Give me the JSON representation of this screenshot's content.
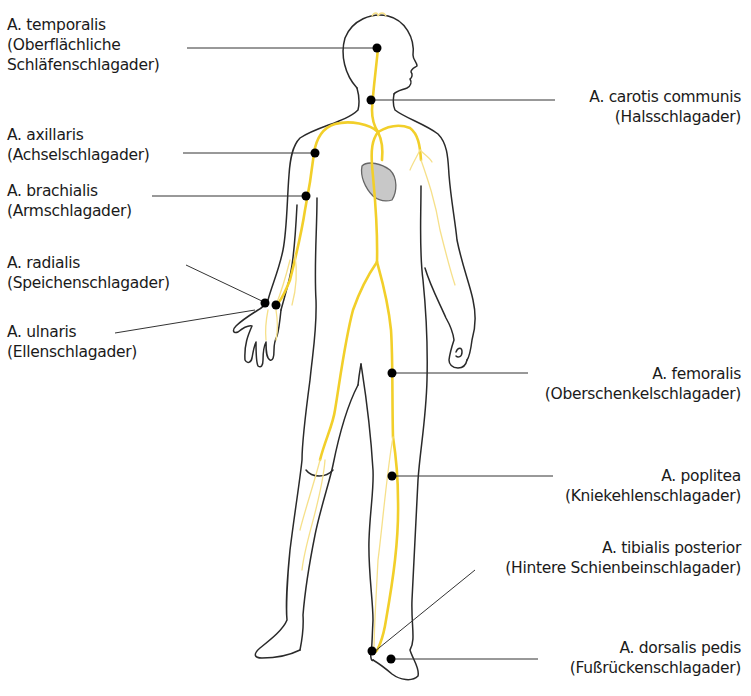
{
  "diagram": {
    "colors": {
      "outline": "#2a2a2a",
      "artery": "#f2cf2a",
      "artery_faint": "#f6e08a",
      "heart": "#c8c8c8",
      "pulse_point": "#000000",
      "leader_line": "#333333"
    },
    "labels_left": [
      {
        "id": "temporalis",
        "name": "A. temporalis",
        "german": [
          "(Oberflächliche",
          "Schläfenschlagader)"
        ]
      },
      {
        "id": "axillaris",
        "name": "A. axillaris",
        "german": [
          "(Achselschlagader)"
        ]
      },
      {
        "id": "brachialis",
        "name": "A. brachialis",
        "german": [
          "(Armschlagader)"
        ]
      },
      {
        "id": "radialis",
        "name": "A. radialis",
        "german": [
          "(Speichenschlagader)"
        ]
      },
      {
        "id": "ulnaris",
        "name": "A. ulnaris",
        "german": [
          "(Ellenschlagader)"
        ]
      }
    ],
    "labels_right": [
      {
        "id": "carotis",
        "name": "A. carotis communis",
        "german": [
          "(Halsschlagader)"
        ]
      },
      {
        "id": "femoralis",
        "name": "A. femoralis",
        "german": [
          "(Oberschenkelschlagader)"
        ]
      },
      {
        "id": "poplitea",
        "name": "A. poplitea",
        "german": [
          "(Kniekehlenschlagader)"
        ]
      },
      {
        "id": "tibialis",
        "name": "A. tibialis posterior",
        "german": [
          "(Hintere Schienbeinschlagader)"
        ]
      },
      {
        "id": "dorsalis",
        "name": "A. dorsalis pedis",
        "german": [
          "(Fußrückenschlagader)"
        ]
      }
    ]
  }
}
